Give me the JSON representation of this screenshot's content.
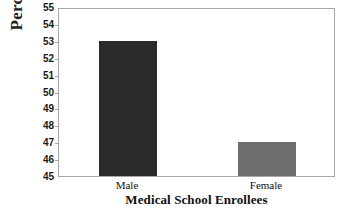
{
  "chart_data": {
    "type": "bar",
    "title": "",
    "subtitle": "",
    "categories": [
      "Male",
      "Female"
    ],
    "values": [
      53,
      47
    ],
    "series": [
      {
        "name": "Percent",
        "values": [
          53,
          47
        ]
      }
    ],
    "xlabel": "Medical School Enrollees",
    "ylabel": "Percent",
    "ylim": [
      45,
      55
    ],
    "yticks": [
      45,
      46,
      47,
      48,
      49,
      50,
      51,
      52,
      53,
      54,
      55
    ],
    "ytick_labels": [
      "45",
      "46",
      "47",
      "48",
      "49",
      "50",
      "51",
      "52",
      "53",
      "54",
      "55"
    ],
    "grid": false,
    "legend": false,
    "legend_position": "none",
    "bar_colors": [
      "#2b2b2b",
      "#6e6e6e"
    ],
    "background_color": "#ffffff",
    "axis_color": "#a6a6a6",
    "text_color": "#111111"
  }
}
